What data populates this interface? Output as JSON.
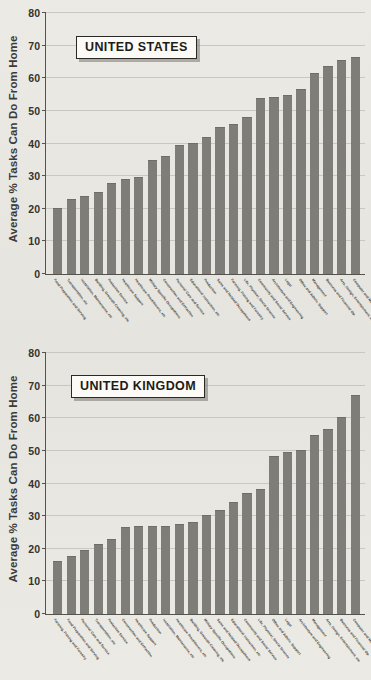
{
  "meta": {
    "ylabel": "Average % Tasks Can Do From Home"
  },
  "chart_data": [
    {
      "type": "bar",
      "title": "UNITED STATES",
      "xlabel": "",
      "ylabel": "Average % Tasks Can Do From Home",
      "ylim": [
        0,
        80
      ],
      "yticks": [
        0,
        10,
        20,
        30,
        40,
        50,
        60,
        70,
        80
      ],
      "grid": true,
      "legend": "none",
      "bar_color": "#7e7d78",
      "categories": [
        "Food Preparation and Serving",
        "Transportation, etc",
        "Installation, Maintenance, etc",
        "Building, Grounds Cleaning, etc",
        "Protective Service",
        "Healthcare Support",
        "Healthcare Practitioners, etc",
        "Military Specific Occupations",
        "Construction and Extraction",
        "Personal Care and Service",
        "Educational Instruction, etc",
        "Production",
        "Sales and Related Occupations",
        "Farming, Fishing and Forestry",
        "Life, Physical, Social Science",
        "Community and Social Service",
        "Architecture and Engineering",
        "Legal",
        "Office and Admin. Support",
        "Management",
        "Business and Financial Op.",
        "Arts, Design, Entertainment, etc",
        "Computer and Mathematical"
      ],
      "values": [
        20.1,
        22.9,
        24.0,
        25.2,
        27.8,
        29.0,
        29.6,
        34.8,
        36.1,
        39.5,
        40.3,
        42.0,
        45.1,
        45.9,
        48.1,
        54.0,
        54.2,
        54.8,
        56.8,
        61.5,
        63.8,
        65.5,
        66.4
      ]
    },
    {
      "type": "bar",
      "title": "UNITED KINGDOM",
      "xlabel": "",
      "ylabel": "Average % Tasks Can Do From Home",
      "ylim": [
        0,
        80
      ],
      "yticks": [
        0,
        10,
        20,
        30,
        40,
        50,
        60,
        70,
        80
      ],
      "grid": true,
      "legend": "none",
      "bar_color": "#7e7d78",
      "categories": [
        "Farming, Fishing and Forestry",
        "Food Preparation and Serving",
        "Personal Care and Service",
        "Transportation, etc",
        "Protective Service",
        "Construction and Extraction",
        "Healthcare Support",
        "Production",
        "Installation, Maintenance, etc",
        "Healthcare Practitioners, etc",
        "Building, Grounds Cleaning, etc",
        "Military Specific Occupations",
        "Sales and Related Occupations",
        "Educational Instruction, etc",
        "Community and Social Service",
        "Life, Physical, Social Science",
        "Office and Admin. Support",
        "Legal",
        "Architecture and Engineering",
        "Management",
        "Arts, Design, Entertainment, etc",
        "Business and Financial Op.",
        "Computer and Mathematical"
      ],
      "values": [
        16.2,
        17.7,
        19.6,
        21.5,
        23.1,
        26.8,
        26.9,
        26.9,
        27.1,
        27.7,
        28.2,
        30.5,
        32.0,
        34.4,
        37.0,
        38.4,
        48.3,
        49.8,
        50.4,
        54.9,
        56.8,
        60.3,
        67.1
      ]
    }
  ]
}
